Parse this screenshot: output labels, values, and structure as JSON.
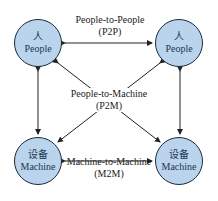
{
  "diagram": {
    "nodes": [
      {
        "id": "people-top-left",
        "zh": "人",
        "en": "People"
      },
      {
        "id": "people-top-right",
        "zh": "人",
        "en": "People"
      },
      {
        "id": "machine-bottom-left",
        "zh": "设备",
        "en": "Machine"
      },
      {
        "id": "machine-bottom-right",
        "zh": "设备",
        "en": "Machine"
      }
    ],
    "edges": {
      "p2p": {
        "line1": "People-to-People",
        "line2": "(P2P)"
      },
      "p2m": {
        "line1": "People-to-Machine",
        "line2": "(P2M)"
      },
      "m2m": {
        "line1": "Machine-to-Machine",
        "line2": "(M2M)"
      }
    },
    "colors": {
      "node_fill": "#b9d4ec",
      "node_border": "#1a2a3a",
      "arrow": "#222222"
    }
  }
}
